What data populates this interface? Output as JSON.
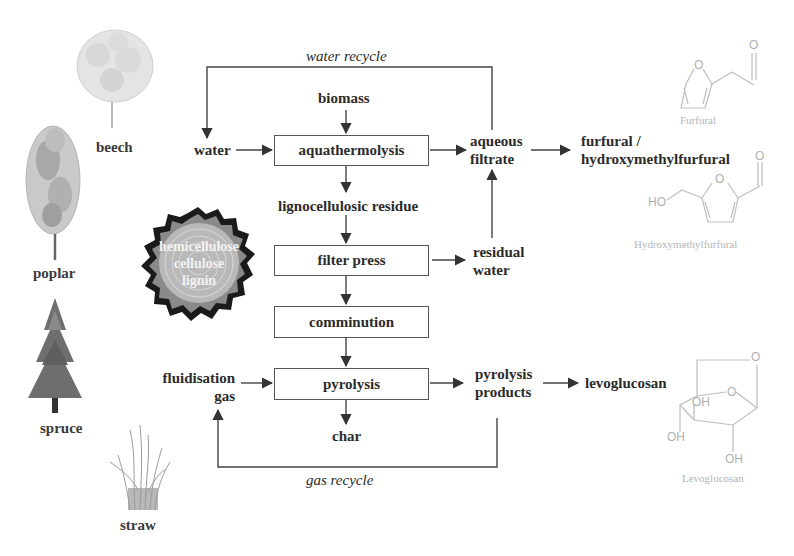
{
  "feedstocks": [
    {
      "id": "beech",
      "label": "beech"
    },
    {
      "id": "poplar",
      "label": "poplar"
    },
    {
      "id": "spruce",
      "label": "spruce"
    },
    {
      "id": "straw",
      "label": "straw"
    }
  ],
  "wood_section": {
    "lines": [
      "hemicellulose",
      "cellulose",
      "lignin"
    ]
  },
  "process": {
    "inputs": {
      "biomass": "biomass",
      "water": "water",
      "fluidisation_gas_line1": "fluidisation",
      "fluidisation_gas_line2": "gas"
    },
    "steps": [
      {
        "id": "aquathermolysis",
        "label": "aquathermolysis"
      },
      {
        "id": "filter-press",
        "label": "filter press"
      },
      {
        "id": "comminution",
        "label": "comminution"
      },
      {
        "id": "pyrolysis",
        "label": "pyrolysis"
      }
    ],
    "intermediates": {
      "lignocellulosic_residue": "lignocellulosic residue",
      "aqueous_filtrate_line1": "aqueous",
      "aqueous_filtrate_line2": "filtrate",
      "residual_water_line1": "residual",
      "residual_water_line2": "water",
      "pyrolysis_products_line1": "pyrolysis",
      "pyrolysis_products_line2": "products",
      "char": "char"
    },
    "products": {
      "furfural_line1": "furfural /",
      "furfural_line2": "hydroxymethylfurfural",
      "levoglucosan": "levoglucosan"
    },
    "recycles": {
      "water_recycle": "water recycle",
      "gas_recycle": "gas recycle"
    }
  },
  "structures": {
    "furfural": {
      "name": "Furfural",
      "atoms": [
        "O",
        "O"
      ]
    },
    "hmf": {
      "name": "Hydroxymethylfurfural",
      "atoms": [
        "O",
        "O",
        "HO"
      ]
    },
    "levoglucosan": {
      "name": "Levoglucosan",
      "atoms": [
        "O",
        "O",
        "OH",
        "OH",
        "OH"
      ]
    }
  },
  "colors": {
    "text": "#2b2b2b",
    "lines": "#444444",
    "structure": "#b4b4b4"
  }
}
